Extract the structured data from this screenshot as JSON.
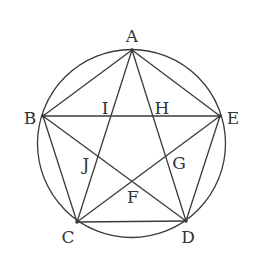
{
  "diagram": {
    "stroke_color": "#3a3a3a",
    "label_color": "#333333",
    "circle": {
      "cx": 131.5,
      "cy": 143.5,
      "r": 94
    },
    "vertices": {
      "A": {
        "x": 132,
        "y": 50
      },
      "B": {
        "x": 43,
        "y": 116
      },
      "C": {
        "x": 77,
        "y": 222
      },
      "D": {
        "x": 186,
        "y": 221
      },
      "E": {
        "x": 220,
        "y": 116
      }
    },
    "intersections": {
      "I": {
        "x": 112,
        "y": 116
      },
      "H": {
        "x": 153,
        "y": 116
      },
      "J": {
        "x": 98,
        "y": 157
      },
      "G": {
        "x": 166,
        "y": 157
      },
      "F": {
        "x": 132,
        "y": 182
      }
    },
    "pentagon_edges": [
      [
        "A",
        "B"
      ],
      [
        "B",
        "C"
      ],
      [
        "C",
        "D"
      ],
      [
        "D",
        "E"
      ],
      [
        "E",
        "A"
      ]
    ],
    "diagonals": [
      [
        "A",
        "C"
      ],
      [
        "A",
        "D"
      ],
      [
        "B",
        "E"
      ],
      [
        "B",
        "D"
      ],
      [
        "C",
        "E"
      ]
    ],
    "labels": [
      {
        "text": "A",
        "x": 132,
        "y": 36
      },
      {
        "text": "B",
        "x": 30,
        "y": 118
      },
      {
        "text": "E",
        "x": 233,
        "y": 118
      },
      {
        "text": "C",
        "x": 68,
        "y": 237
      },
      {
        "text": "D",
        "x": 188,
        "y": 237
      },
      {
        "text": "I",
        "x": 105,
        "y": 108
      },
      {
        "text": "H",
        "x": 162,
        "y": 108
      },
      {
        "text": "J",
        "x": 86,
        "y": 164
      },
      {
        "text": "G",
        "x": 179,
        "y": 163
      },
      {
        "text": "F",
        "x": 133,
        "y": 197
      }
    ]
  }
}
